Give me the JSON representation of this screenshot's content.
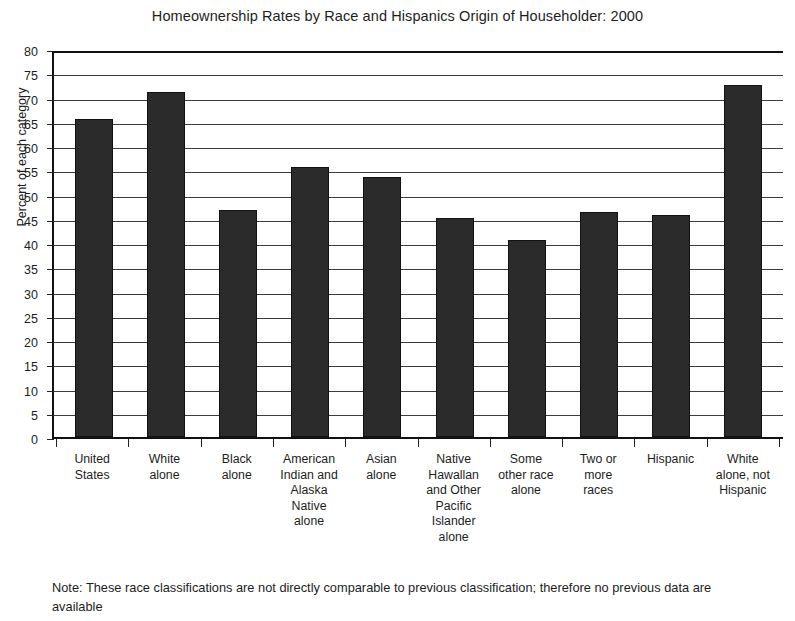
{
  "chart_data": {
    "type": "bar",
    "title": "Homeownership Rates by Race and Hispanics Origin of Householder: 2000",
    "xlabel": "",
    "ylabel": "Percent of each category",
    "ylim": [
      0,
      80
    ],
    "ytick_step": 5,
    "grid": true,
    "legend": null,
    "categories": [
      "United States",
      "White alone",
      "Black alone",
      "American Indian and Alaska Native alone",
      "Asian alone",
      "Native Hawallan and Other Pacific Islander alone",
      "Some other race alone",
      "Two or more races",
      "Hispanic",
      "White alone, not Hispanic"
    ],
    "category_lines": [
      [
        "United",
        "States"
      ],
      [
        "White",
        "alone"
      ],
      [
        "Black",
        "alone"
      ],
      [
        "American",
        "Indian and",
        "Alaska",
        "Native",
        "alone"
      ],
      [
        "Asian",
        "alone"
      ],
      [
        "Native",
        "Hawallan",
        "and Other",
        "Pacific",
        "Islander",
        "alone"
      ],
      [
        "Some",
        "other race",
        "alone"
      ],
      [
        "Two or",
        "more",
        "races"
      ],
      [
        "Hispanic"
      ],
      [
        "White",
        "alone, not",
        "Hispanic"
      ]
    ],
    "values": [
      65.6,
      71.2,
      46.8,
      55.6,
      53.7,
      45.1,
      40.7,
      46.3,
      45.7,
      72.5
    ],
    "ytick_labels": [
      "80",
      "75",
      "70",
      "65",
      "60",
      "55",
      "50",
      "45",
      "40",
      "35",
      "30",
      "25",
      "20",
      "15",
      "10",
      "5",
      "0"
    ],
    "bar_color": "#2b2b2b",
    "axis_color": "#111111",
    "grid_color": "#3b3b3b",
    "background_color": "#ffffff"
  },
  "note": {
    "text": "Note: These race classifications are not directly comparable to previous classification; therefore no previous data are available"
  }
}
